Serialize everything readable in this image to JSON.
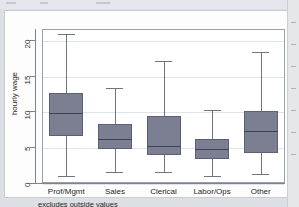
{
  "figure": {
    "caption": "excludes outside values",
    "y_axis_title": "hourly wage",
    "box_fill_color": "#7b7f91",
    "box_border_color": "#5c6070",
    "median_color": "#3d4150",
    "whisker_color": "#6e7480",
    "grid_color": "#dfe3ea",
    "frame_color": "#9aa0aa",
    "plot_background": "#ffffff",
    "page_background": "#dcdfe4"
  },
  "chart_data": {
    "type": "box",
    "title": "",
    "subtitle": "",
    "xlabel": "",
    "ylabel": "hourly wage",
    "ylim": [
      0,
      21.5
    ],
    "yticks": [
      0,
      5,
      10,
      15,
      20
    ],
    "ytick_labels": [
      "0",
      "5",
      "10",
      "15",
      "20"
    ],
    "grid": true,
    "legend": "none",
    "annotations": [
      "excludes outside values"
    ],
    "categories": [
      "Prof/Mgmt",
      "Sales",
      "Clerical",
      "Labor/Ops",
      "Other"
    ],
    "series": [
      {
        "name": "Prof/Mgmt",
        "whisker_low": 1.0,
        "q1": 6.5,
        "median": 9.8,
        "q3": 12.5,
        "whisker_high": 20.8
      },
      {
        "name": "Sales",
        "whisker_low": 1.6,
        "q1": 4.7,
        "median": 6.2,
        "q3": 8.2,
        "whisker_high": 13.3
      },
      {
        "name": "Clerical",
        "whisker_low": 1.5,
        "q1": 3.9,
        "median": 5.2,
        "q3": 9.4,
        "whisker_high": 17.0
      },
      {
        "name": "Labor/Ops",
        "whisker_low": 1.0,
        "q1": 3.4,
        "median": 4.7,
        "q3": 6.1,
        "whisker_high": 10.2
      },
      {
        "name": "Other",
        "whisker_low": 1.2,
        "q1": 4.2,
        "median": 7.2,
        "q3": 10.1,
        "whisker_high": 18.3
      }
    ]
  }
}
